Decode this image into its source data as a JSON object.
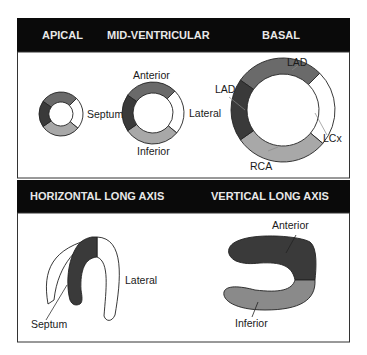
{
  "colors": {
    "header_bg": "#0a0a0a",
    "header_text": "#e8e8e8",
    "lad": "#3a3a3a",
    "lad_anterior": "#6a6a6a",
    "rca": "#a8a8a8",
    "lcx": "#ffffff",
    "outline": "#222222"
  },
  "top_panel": {
    "headers": [
      "APICAL",
      "MID-VENTRICULAR",
      "BASAL"
    ],
    "apical": {
      "label": "Septum"
    },
    "mid": {
      "labels": {
        "anterior": "Anterior",
        "lateral": "Lateral",
        "inferior": "Inferior"
      }
    },
    "basal": {
      "labels": {
        "lad_top": "LAD",
        "lad_left": "LAD",
        "lcx": "LCx",
        "rca": "RCA"
      }
    }
  },
  "bottom_panel": {
    "headers": [
      "HORIZONTAL LONG AXIS",
      "VERTICAL LONG AXIS"
    ],
    "horizontal": {
      "labels": {
        "lateral": "Lateral",
        "septum": "Septum"
      }
    },
    "vertical": {
      "labels": {
        "anterior": "Anterior",
        "inferior": "Inferior"
      }
    }
  }
}
